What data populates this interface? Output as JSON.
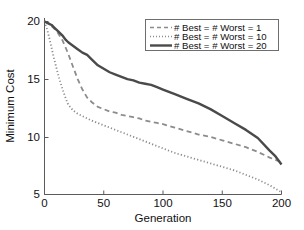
{
  "chart_data": {
    "type": "line",
    "title": "",
    "xlabel": "Generation",
    "ylabel": "Minimum Cost",
    "xlim": [
      0,
      200
    ],
    "ylim": [
      5,
      20
    ],
    "xticks": [
      0,
      50,
      100,
      150,
      200
    ],
    "yticks": [
      5,
      10,
      15,
      20
    ],
    "grid": false,
    "legend_position": "top-right",
    "x": [
      0,
      2,
      4,
      6,
      8,
      10,
      12,
      15,
      18,
      20,
      24,
      28,
      32,
      36,
      40,
      45,
      50,
      55,
      60,
      65,
      70,
      75,
      80,
      85,
      90,
      95,
      100,
      110,
      120,
      130,
      140,
      150,
      160,
      170,
      180,
      190,
      195,
      200
    ],
    "series": [
      {
        "name": "# Best = # Worst = 1",
        "style": "dashed",
        "color": "#8c8c8c",
        "values": [
          20.0,
          19.9,
          19.8,
          19.6,
          19.4,
          19.2,
          18.9,
          18.4,
          17.7,
          17.2,
          16.1,
          15.0,
          14.1,
          13.4,
          13.0,
          12.6,
          12.4,
          12.2,
          12.1,
          11.9,
          11.8,
          11.7,
          11.6,
          11.4,
          11.3,
          11.2,
          11.1,
          10.8,
          10.5,
          10.2,
          10.0,
          9.7,
          9.4,
          9.1,
          8.7,
          8.2,
          8.0,
          7.8
        ]
      },
      {
        "name": "# Best = # Worst = 10",
        "style": "dotted",
        "color": "#8c8c8c",
        "values": [
          20.0,
          19.4,
          18.6,
          17.7,
          16.8,
          16.0,
          15.2,
          14.2,
          13.3,
          12.8,
          12.3,
          12.0,
          11.8,
          11.6,
          11.4,
          11.2,
          11.0,
          10.8,
          10.6,
          10.4,
          10.2,
          10.0,
          9.8,
          9.6,
          9.4,
          9.2,
          9.0,
          8.6,
          8.3,
          8.0,
          7.7,
          7.4,
          7.1,
          6.7,
          6.3,
          5.8,
          5.5,
          5.2
        ]
      },
      {
        "name": "# Best = # Worst = 20",
        "style": "solid",
        "color": "#4a4a4a",
        "values": [
          20.0,
          19.9,
          19.8,
          19.7,
          19.5,
          19.3,
          19.1,
          18.8,
          18.4,
          18.2,
          17.9,
          17.6,
          17.3,
          17.1,
          16.7,
          16.2,
          15.9,
          15.6,
          15.4,
          15.2,
          15.0,
          14.9,
          14.7,
          14.6,
          14.5,
          14.3,
          14.1,
          13.7,
          13.3,
          12.9,
          12.4,
          11.8,
          11.2,
          10.6,
          9.9,
          8.8,
          8.3,
          7.6
        ]
      }
    ]
  },
  "legend": {
    "entries": [
      {
        "label": "# Best = # Worst = 1",
        "style": "dashed"
      },
      {
        "label": "# Best = # Worst = 10",
        "style": "dotted"
      },
      {
        "label": "# Best = # Worst = 20",
        "style": "solid"
      }
    ]
  },
  "axes": {
    "x_title": "Generation",
    "y_title": "Minimum Cost",
    "x_tick_labels": [
      "0",
      "50",
      "100",
      "150",
      "200"
    ],
    "y_tick_labels": [
      "5",
      "10",
      "15",
      "20"
    ]
  },
  "colors": {
    "axis": "#5a5a5a",
    "solid_series": "#4a4a4a",
    "light_series": "#8c8c8c",
    "text": "#111111",
    "background": "#ffffff"
  }
}
